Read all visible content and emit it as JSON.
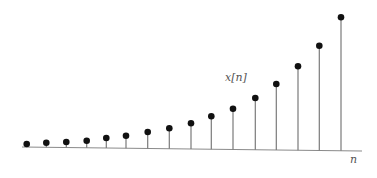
{
  "chart_data": {
    "type": "stem",
    "title": "",
    "xlabel": "n",
    "ylabel": "x[n]",
    "series": [
      {
        "name": "x[n]",
        "values": [
          4,
          5,
          6,
          7,
          10,
          12.5,
          16.5,
          20.5,
          26,
          33,
          41,
          51.5,
          66,
          84,
          105,
          134
        ]
      }
    ],
    "x": [
      0,
      1,
      2,
      3,
      4,
      5,
      6,
      7,
      8,
      9,
      10,
      11,
      12,
      13,
      14,
      15
    ],
    "grid": false,
    "legend": "none",
    "axis": {
      "x_start_px": 22,
      "x_end_px": 362,
      "baseline_left_px": 147,
      "baseline_right_px": 151
    },
    "stem_x_px": [
      26.7,
      46.3,
      66.3,
      86.7,
      106.3,
      126,
      147.7,
      169.3,
      191,
      211.3,
      233,
      255.3,
      276.3,
      298,
      319.3,
      341
    ],
    "dot_y_px": [
      144,
      142.7,
      142,
      140.7,
      138,
      135.7,
      132,
      128.3,
      123.3,
      116.3,
      108.7,
      98,
      84,
      66.3,
      45.7,
      17.3
    ],
    "dot_radius_px": 3.3,
    "colors": {
      "dot": "#111111",
      "stem": "#7a7a7a",
      "axis": "#8a8a8a",
      "label": "#555555"
    }
  },
  "labels": {
    "y": "x[n]",
    "x": "n"
  }
}
